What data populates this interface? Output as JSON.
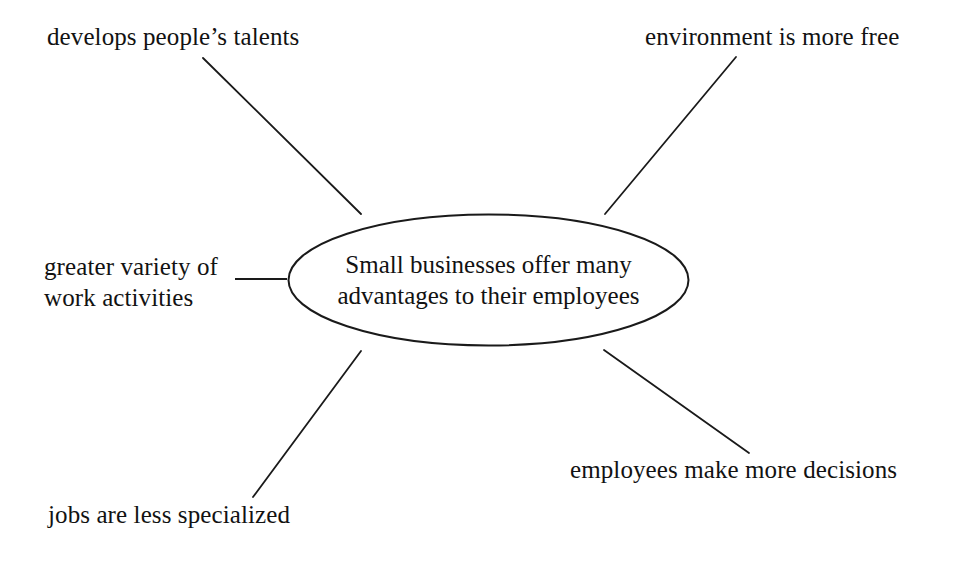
{
  "diagram": {
    "type": "concept-map",
    "title_node": {
      "text": "Small businesses offer many\nadvantages to their employees",
      "shape": "ellipse",
      "stroke_color": "#1a1a1a",
      "fill_color": "#ffffff"
    },
    "background_color": "#ffffff",
    "text_color": "#121212",
    "connector_color": "#1a1a1a",
    "branches": [
      {
        "id": "develops-talents",
        "label": "develops people’s talents",
        "position": "top-left",
        "connector": {
          "x1": 203,
          "y1": 58,
          "x2": 361,
          "y2": 214
        }
      },
      {
        "id": "environment-free",
        "label": "environment is more free",
        "position": "top-right",
        "connector": {
          "x1": 736,
          "y1": 57,
          "x2": 605,
          "y2": 214
        }
      },
      {
        "id": "greater-variety",
        "label": "greater variety of\nwork activities",
        "position": "left",
        "connector": {
          "x1": 235,
          "y1": 279,
          "x2": 287,
          "y2": 279
        }
      },
      {
        "id": "jobs-less-specialized",
        "label": "jobs are less specialized",
        "position": "bottom-left",
        "connector": {
          "x1": 361,
          "y1": 351,
          "x2": 253,
          "y2": 497
        }
      },
      {
        "id": "employees-decisions",
        "label": "employees make more decisions",
        "position": "bottom-right",
        "connector": {
          "x1": 604,
          "y1": 350,
          "x2": 749,
          "y2": 453
        }
      }
    ]
  }
}
